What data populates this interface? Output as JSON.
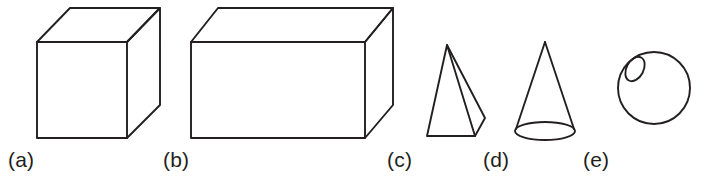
{
  "figure": {
    "background_color": "#ffffff",
    "stroke_color": "#231f20",
    "stroke_width": 1.9,
    "width": 714,
    "height": 186
  },
  "shapes": [
    {
      "key": "cube",
      "label": "(a)",
      "name": "cube",
      "kind": "hexahedron",
      "description": "Cube drawn in oblique projection with visible top face and right face",
      "geometry": {
        "front_face": "37,42 127,42 127,138 37,138",
        "top_face": "37,42 70,8 160,8 127,42",
        "right_face": "127,42 160,8 160,105 127,138"
      }
    },
    {
      "key": "rectangular-prism",
      "label": "(b)",
      "name": "rectangular prism",
      "kind": "cuboid",
      "description": "Rectangular prism drawn in oblique projection, wider than tall",
      "geometry": {
        "front_face": "191,42 365,42 365,138 191,138",
        "top_face": "191,42 218,8 393,8 365,42",
        "right_face": "365,42 393,8 393,105 365,138"
      }
    },
    {
      "key": "pyramid",
      "label": "(c)",
      "name": "pyramid",
      "kind": "square-pyramid",
      "description": "Pyramid with apex at top, triangular front face and narrow right face",
      "geometry": {
        "front_face": "447,45 427,136 475,136",
        "right_face": "447,45 485,118 475,136"
      }
    },
    {
      "key": "cone",
      "label": "(d)",
      "name": "cone",
      "kind": "cone",
      "description": "Cone with apex at top and elliptical base",
      "geometry": {
        "apex": "545,42",
        "left_side": "545,42 515,131",
        "right_side": "545,42 575,131",
        "base_ellipse": {
          "cx": 545,
          "cy": 131,
          "rx": 30,
          "ry": 9
        }
      }
    },
    {
      "key": "sphere",
      "label": "(e)",
      "name": "sphere",
      "kind": "sphere",
      "description": "Circle representing a sphere with a small tilted ellipse highlight in the upper-left",
      "geometry": {
        "outline": {
          "cx": 654,
          "cy": 88,
          "r": 36
        },
        "highlight_ellipse": {
          "cx": 635,
          "cy": 69,
          "rx": 8.5,
          "ry": 13,
          "rotation": 28
        }
      }
    }
  ],
  "captions": {
    "a": "(a)",
    "b": "(b)",
    "c": "(c)",
    "d": "(d)",
    "e": "(e)"
  }
}
